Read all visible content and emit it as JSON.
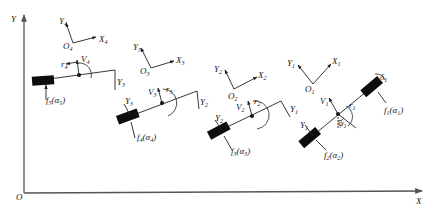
{
  "global_frame": {
    "origin_label": "O",
    "x_label": "X",
    "y_label": "Y"
  },
  "local_frames": [
    {
      "origin": "O",
      "origin_sub": "1",
      "x": "X",
      "x_sub": "1",
      "y": "Y",
      "y_sub": "1"
    },
    {
      "origin": "O",
      "origin_sub": "2",
      "x": "X",
      "x_sub": "2",
      "y": "Y",
      "y_sub": "2"
    },
    {
      "origin": "O",
      "origin_sub": "3",
      "x": "X",
      "x_sub": "3",
      "y": "Y",
      "y_sub": "3"
    },
    {
      "origin": "O",
      "origin_sub": "4",
      "x": "X",
      "x_sub": "4",
      "y": "Y",
      "y_sub": "4"
    }
  ],
  "segments": [
    {
      "id": 1,
      "V": "V",
      "V_sub": "1",
      "r": "r",
      "r_sub": "1",
      "Y": "Y",
      "Y_sub": "1",
      "psi": "ψ",
      "psi_sub": "1",
      "delta": "δ",
      "delta_sub": "1"
    },
    {
      "id": 2,
      "V": "V",
      "V_sub": "2",
      "r": "r",
      "r_sub": "2",
      "Y": "Y",
      "Y_sub": "2"
    },
    {
      "id": 3,
      "V": "V",
      "V_sub": "3",
      "r": "r",
      "r_sub": "3",
      "Y": "Y",
      "Y_sub": "3"
    },
    {
      "id": 4,
      "V": "V",
      "V_sub": "4",
      "r": "r",
      "r_sub": "4"
    }
  ],
  "tire_forces": [
    {
      "f": "f",
      "f_sub": "1",
      "alpha": "α",
      "alpha_sub": "1"
    },
    {
      "f": "f",
      "f_sub": "2",
      "alpha": "α",
      "alpha_sub": "2"
    },
    {
      "f": "f",
      "f_sub": "3",
      "alpha": "α",
      "alpha_sub": "3"
    },
    {
      "f": "f",
      "f_sub": "4",
      "alpha": "α",
      "alpha_sub": "4"
    },
    {
      "f": "f",
      "f_sub": "5",
      "alpha": "α",
      "alpha_sub": "5"
    }
  ],
  "hitch_labels": [
    {
      "Y": "Y",
      "Y_sub": "1"
    },
    {
      "Y": "Y",
      "Y_sub": "2"
    },
    {
      "Y": "Y",
      "Y_sub": "3"
    }
  ]
}
